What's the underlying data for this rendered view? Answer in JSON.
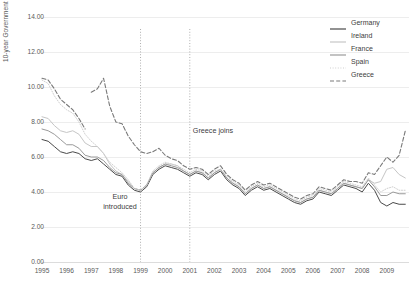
{
  "chart_data": {
    "type": "line",
    "title": "",
    "xlabel": "",
    "ylabel": "10-year Government Bond Yields, Percent",
    "ylim": [
      0,
      14
    ],
    "ytick_labels": [
      "0.00",
      "2.00",
      "4.00",
      "6.00",
      "8.00",
      "10.00",
      "12.00",
      "14.00"
    ],
    "ytick_values": [
      0,
      2,
      4,
      6,
      8,
      10,
      12,
      14
    ],
    "xlim": [
      1995,
      2009.9
    ],
    "xtick_labels": [
      "1995",
      "1996",
      "1997",
      "1998",
      "1999",
      "2000",
      "2001",
      "2002",
      "2003",
      "2004",
      "2005",
      "2006",
      "2007",
      "2008",
      "2009"
    ],
    "xtick_values": [
      1995,
      1996,
      1997,
      1998,
      1999,
      2000,
      2001,
      2002,
      2003,
      2004,
      2005,
      2006,
      2007,
      2008,
      2009
    ],
    "grid": "horizontal",
    "legend_position": "top-right",
    "x": [
      1995.0,
      1995.25,
      1995.5,
      1995.75,
      1996.0,
      1996.25,
      1996.5,
      1996.75,
      1997.0,
      1997.25,
      1997.5,
      1997.75,
      1998.0,
      1998.25,
      1998.5,
      1998.75,
      1999.0,
      1999.25,
      1999.5,
      1999.75,
      2000.0,
      2000.25,
      2000.5,
      2000.75,
      2001.0,
      2001.25,
      2001.5,
      2001.75,
      2002.0,
      2002.25,
      2002.5,
      2002.75,
      2003.0,
      2003.25,
      2003.5,
      2003.75,
      2004.0,
      2004.25,
      2004.5,
      2004.75,
      2005.0,
      2005.25,
      2005.5,
      2005.75,
      2006.0,
      2006.25,
      2006.5,
      2006.75,
      2007.0,
      2007.25,
      2007.5,
      2007.75,
      2008.0,
      2008.25,
      2008.5,
      2008.75,
      2009.0,
      2009.25,
      2009.5,
      2009.75
    ],
    "series": [
      {
        "name": "Germany",
        "color": "#4a4a4a",
        "dash": "none",
        "width": 1.0,
        "values": [
          7.0,
          6.9,
          6.6,
          6.3,
          6.2,
          6.3,
          6.2,
          5.9,
          5.8,
          5.9,
          5.6,
          5.3,
          5.0,
          4.9,
          4.4,
          4.1,
          4.0,
          4.3,
          5.0,
          5.3,
          5.5,
          5.4,
          5.3,
          5.1,
          4.9,
          5.1,
          5.0,
          4.7,
          5.0,
          5.2,
          4.7,
          4.4,
          4.2,
          3.8,
          4.1,
          4.3,
          4.1,
          4.2,
          4.0,
          3.8,
          3.6,
          3.4,
          3.3,
          3.5,
          3.6,
          4.0,
          3.9,
          3.8,
          4.1,
          4.4,
          4.3,
          4.2,
          4.0,
          4.5,
          4.1,
          3.4,
          3.2,
          3.4,
          3.3,
          3.3
        ]
      },
      {
        "name": "Ireland",
        "color": "#c6c6c6",
        "dash": "none",
        "width": 1.0,
        "values": [
          8.3,
          8.2,
          7.8,
          7.5,
          7.4,
          7.5,
          7.3,
          6.8,
          6.6,
          6.6,
          6.2,
          5.6,
          5.2,
          5.0,
          4.6,
          4.2,
          4.1,
          4.4,
          5.1,
          5.4,
          5.6,
          5.6,
          5.5,
          5.2,
          5.0,
          5.2,
          5.1,
          4.8,
          5.1,
          5.3,
          4.8,
          4.5,
          4.3,
          3.9,
          4.2,
          4.4,
          4.2,
          4.3,
          4.1,
          3.9,
          3.7,
          3.5,
          3.4,
          3.6,
          3.7,
          4.1,
          4.0,
          3.9,
          4.2,
          4.5,
          4.4,
          4.3,
          4.2,
          4.7,
          4.5,
          4.6,
          5.3,
          5.4,
          5.0,
          4.8
        ]
      },
      {
        "name": "France",
        "color": "#9a9a9a",
        "dash": "none",
        "width": 1.0,
        "values": [
          7.6,
          7.5,
          7.3,
          7.0,
          6.7,
          6.7,
          6.5,
          6.1,
          6.0,
          6.0,
          5.8,
          5.4,
          5.1,
          5.0,
          4.5,
          4.2,
          4.1,
          4.4,
          5.1,
          5.4,
          5.6,
          5.5,
          5.4,
          5.2,
          5.0,
          5.2,
          5.1,
          4.8,
          5.1,
          5.3,
          4.8,
          4.5,
          4.3,
          3.9,
          4.2,
          4.4,
          4.2,
          4.3,
          4.1,
          3.9,
          3.7,
          3.5,
          3.4,
          3.6,
          3.7,
          4.1,
          4.0,
          3.9,
          4.2,
          4.5,
          4.4,
          4.3,
          4.2,
          4.7,
          4.3,
          3.8,
          3.8,
          4.0,
          3.9,
          3.9
        ]
      },
      {
        "name": "Spain",
        "color": "#cfcfcf",
        "dash": "dotted",
        "width": 1.0,
        "values": [
          10.4,
          10.2,
          9.5,
          9.0,
          8.7,
          8.5,
          8.0,
          7.3,
          6.9,
          6.6,
          6.2,
          5.7,
          5.4,
          5.1,
          4.7,
          4.2,
          4.1,
          4.4,
          5.2,
          5.5,
          5.7,
          5.6,
          5.5,
          5.3,
          5.1,
          5.3,
          5.2,
          4.9,
          5.2,
          5.3,
          4.9,
          4.6,
          4.4,
          4.0,
          4.3,
          4.5,
          4.3,
          4.4,
          4.2,
          4.0,
          3.8,
          3.6,
          3.5,
          3.7,
          3.8,
          4.2,
          4.1,
          4.0,
          4.3,
          4.6,
          4.5,
          4.4,
          4.3,
          4.8,
          4.4,
          4.0,
          4.2,
          4.3,
          4.1,
          4.1
        ]
      },
      {
        "name": "Greece",
        "color": "#7a7a7a",
        "dash": "dashed",
        "width": 1.1,
        "values": [
          null,
          null,
          null,
          null,
          null,
          null,
          null,
          null,
          9.7,
          9.9,
          10.5,
          8.9,
          8.0,
          7.9,
          7.2,
          6.7,
          6.3,
          6.2,
          6.3,
          6.5,
          6.1,
          5.9,
          5.8,
          5.5,
          5.3,
          5.4,
          5.3,
          5.0,
          5.3,
          5.5,
          5.0,
          4.7,
          4.5,
          4.1,
          4.4,
          4.6,
          4.4,
          4.5,
          4.3,
          4.1,
          3.9,
          3.7,
          3.6,
          3.8,
          3.9,
          4.3,
          4.2,
          4.1,
          4.4,
          4.7,
          4.6,
          4.6,
          4.5,
          5.1,
          5.0,
          5.5,
          6.0,
          5.7,
          6.1,
          7.5
        ]
      }
    ],
    "early_greece": {
      "comment": "Greece segment 1995-1996 before gap",
      "x": [
        1995.0,
        1995.25,
        1995.5,
        1995.75,
        1996.0,
        1996.25,
        1996.5,
        1996.75
      ],
      "values": [
        10.5,
        10.4,
        9.9,
        9.3,
        9.0,
        8.7,
        8.2,
        7.6
      ]
    },
    "annotations": [
      {
        "name": "euro-introduced",
        "text_line1": "Euro",
        "text_line2": "introduced",
        "x_px": 120,
        "y_px": 192,
        "marker_year": 1999
      },
      {
        "name": "greece-joins",
        "text_line1": "Greece joins",
        "text_line2": "",
        "x_px": 213,
        "y_px": 126,
        "marker_year": 2001
      }
    ],
    "vertical_markers": [
      {
        "name": "euro-line",
        "year": 1999,
        "style": "dotted"
      },
      {
        "name": "greece-line",
        "year": 2001,
        "style": "dotted"
      }
    ]
  },
  "legend": {
    "items": [
      {
        "label": "Germany",
        "color": "#4a4a4a",
        "dash": "none"
      },
      {
        "label": "Ireland",
        "color": "#c6c6c6",
        "dash": "none"
      },
      {
        "label": "France",
        "color": "#9a9a9a",
        "dash": "none"
      },
      {
        "label": "Spain",
        "color": "#cfcfcf",
        "dash": "dotted"
      },
      {
        "label": "Greece",
        "color": "#7a7a7a",
        "dash": "dashed"
      }
    ]
  }
}
